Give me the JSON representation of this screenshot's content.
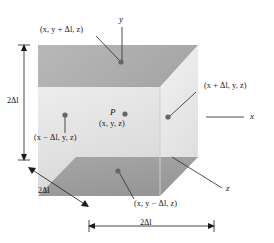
{
  "figure": {
    "type": "3d-cube-diagram",
    "background_color": "#ffffff",
    "line_color": "#1a1a1a",
    "dot_color": "#5b5b5b",
    "faces": {
      "front": {
        "name": "front-face",
        "fill_top": "#e9e9e9",
        "fill_bottom": "#dcdcdc"
      },
      "top": {
        "name": "top-face",
        "fill_left": "#b4b4b4",
        "fill_right": "#a9a9a9"
      },
      "right": {
        "name": "right-face",
        "fill_top": "#efefef",
        "fill_bottom": "#e2e2e2"
      },
      "bottom": {
        "name": "bottom-face",
        "fill": "#9f9f9f"
      },
      "inner_shadow": {
        "name": "inner-shadow-face",
        "fill": "#cfcfcf"
      }
    },
    "axes": [
      {
        "id": "y-axis",
        "label": "y",
        "orientation": "vertical-top"
      },
      {
        "id": "x-axis",
        "label": "x",
        "orientation": "horizontal-right"
      },
      {
        "id": "z-axis",
        "label": "z",
        "orientation": "diagonal-lower-right"
      }
    ],
    "point_labels": [
      {
        "id": "point-top",
        "text": "(x, y + Δl, z)",
        "position": "top-left-callout"
      },
      {
        "id": "point-right",
        "text": "(x + Δl, y, z)",
        "position": "right-callout"
      },
      {
        "id": "point-left",
        "text": "(x − Δl, y, z)",
        "position": "left-callout"
      },
      {
        "id": "point-bottom",
        "text": "(x, y − Δl, z)",
        "position": "bottom-callout"
      },
      {
        "id": "point-center-name",
        "text": "P",
        "position": "center"
      },
      {
        "id": "point-center-coords",
        "text": "(x, y, z)",
        "position": "center-below"
      }
    ],
    "dimensions": [
      {
        "id": "dim-height",
        "text": "2Δl",
        "orientation": "vertical-left"
      },
      {
        "id": "dim-depth",
        "text": "2Δl",
        "orientation": "diagonal-bottom-left"
      },
      {
        "id": "dim-width",
        "text": "2Δl",
        "orientation": "horizontal-bottom"
      }
    ]
  },
  "labels": {
    "top_point": "(x, y + Δl, z)",
    "right_point": "(x + Δl, y, z)",
    "left_point": "(x − Δl, y, z)",
    "bottom_point": "(x, y − Δl, z)",
    "center_point_name": "P",
    "center_point_coords": "(x, y, z)",
    "axis_y": "y",
    "axis_x": "x",
    "axis_z": "z",
    "dim_height": "2Δl",
    "dim_depth": "2Δl",
    "dim_width": "2Δl"
  }
}
